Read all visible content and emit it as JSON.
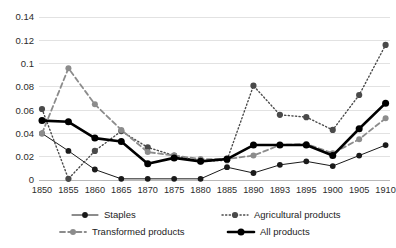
{
  "chart_data": {
    "type": "line",
    "title": "",
    "subtitle": "",
    "xlabel": "",
    "ylabel": "",
    "grid": true,
    "legend_position": "bottom",
    "ylim": [
      0,
      0.14
    ],
    "ytick_labels": [
      "0",
      "0.02",
      "0.04",
      "0.06",
      "0.08",
      "0.1",
      "0.12",
      "0.14"
    ],
    "ytick_values": [
      0,
      0.02,
      0.04,
      0.06,
      0.08,
      0.1,
      0.12,
      0.14
    ],
    "categories": [
      "1850",
      "1855",
      "1860",
      "1865",
      "1870",
      "1875",
      "1880",
      "1885",
      "1890",
      "1893",
      "1895",
      "1900",
      "1905",
      "1910"
    ],
    "series": [
      {
        "name": "Staples",
        "style": "thin-solid",
        "color": "#1a1a1a",
        "values": [
          0.04,
          0.025,
          0.009,
          0.001,
          0.001,
          0.001,
          0.001,
          0.011,
          0.006,
          0.013,
          0.016,
          0.012,
          0.021,
          0.03
        ]
      },
      {
        "name": "Agricultural products",
        "style": "dotted",
        "color": "#4a4a4a",
        "values": [
          0.061,
          0.001,
          0.025,
          0.042,
          0.028,
          0.021,
          0.016,
          0.017,
          0.081,
          0.056,
          0.054,
          0.043,
          0.073,
          0.116
        ]
      },
      {
        "name": "Transformed products",
        "style": "dashed",
        "color": "#8c8c8c",
        "values": [
          0.04,
          0.096,
          0.065,
          0.043,
          0.024,
          0.021,
          0.018,
          0.018,
          0.021,
          0.03,
          0.031,
          0.023,
          0.035,
          0.053
        ]
      },
      {
        "name": "All products",
        "style": "thick-solid",
        "color": "#000000",
        "values": [
          0.051,
          0.05,
          0.036,
          0.033,
          0.014,
          0.019,
          0.016,
          0.018,
          0.03,
          0.03,
          0.03,
          0.021,
          0.044,
          0.066
        ]
      }
    ]
  },
  "legend": {
    "items": [
      {
        "label": "Staples",
        "marker": "line-marker-thin-solid"
      },
      {
        "label": "Agricultural products",
        "marker": "line-marker-dotted"
      },
      {
        "label": "Transformed products",
        "marker": "line-marker-dashed"
      },
      {
        "label": "All products",
        "marker": "line-marker-thick-solid"
      }
    ]
  },
  "colors": {
    "background": "#ffffff",
    "grid": "#e2e2e2",
    "axis": "#b9b9b9",
    "text": "#1c1c1c"
  }
}
